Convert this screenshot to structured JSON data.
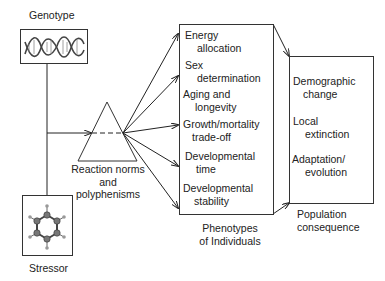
{
  "genotype": {
    "label": "Genotype",
    "icon": "dna-helix-icon"
  },
  "stressor": {
    "label": "Stressor",
    "icon": "benzene-molecule-icon"
  },
  "reaction": {
    "line1": "Reaction norms",
    "line2": "and",
    "line3": "polyphenisms"
  },
  "phenotypes": {
    "caption_line1": "Phenotypes",
    "caption_line2": "of Individuals",
    "items": [
      {
        "line1": "Energy",
        "line2": "allocation"
      },
      {
        "line1": "Sex",
        "line2": "determination"
      },
      {
        "line1": "Aging and",
        "line2": "longevity"
      },
      {
        "line1": "Growth/mortality",
        "line2": "trade-off"
      },
      {
        "line1": "Developmental",
        "line2": "time"
      },
      {
        "line1": "Developmental",
        "line2": "stability"
      }
    ]
  },
  "population": {
    "caption_line1": "Population",
    "caption_line2": "consequence",
    "items": [
      {
        "line1": "Demographic",
        "line2": "change"
      },
      {
        "line1": "Local",
        "line2": "extinction"
      },
      {
        "line1": "Adaptation/",
        "line2": "evolution"
      }
    ]
  }
}
